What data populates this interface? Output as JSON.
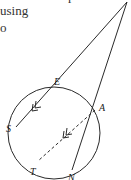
{
  "text": {
    "lines": [
      "r",
      "using",
      "o"
    ]
  },
  "diagram": {
    "stroke_color": "#2a2a2a",
    "points": {
      "apex": {
        "x": 127,
        "y": 2
      },
      "E": {
        "x": 60,
        "y": 88,
        "label": "E"
      },
      "A": {
        "x": 95,
        "y": 110,
        "label": "A"
      },
      "S": {
        "x": 16,
        "y": 127,
        "label": "S"
      },
      "T": {
        "x": 38,
        "y": 161,
        "label": "T"
      },
      "N": {
        "x": 72,
        "y": 170,
        "label": "N"
      }
    },
    "circle": {
      "cx": 54,
      "cy": 133,
      "r": 46
    },
    "labels": {
      "E": "E",
      "A": "A",
      "S": "S",
      "T": "T",
      "N": "N"
    },
    "parallel_marker": "double-arrow"
  }
}
